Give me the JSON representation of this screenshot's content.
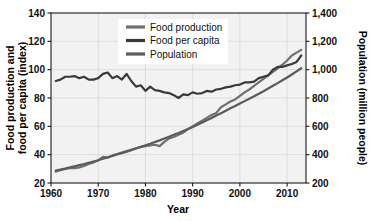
{
  "chart_data": {
    "type": "line",
    "title": "",
    "subtitle": "",
    "xlabel": "Year",
    "ylabel": "Food production and food per capita (index)",
    "ylabel_line1": "Food production and",
    "ylabel_line2": "food per capita (index)",
    "y2label": "Population (million people)",
    "xlim": [
      1960,
      2014
    ],
    "ylim": [
      20,
      140
    ],
    "y2lim": [
      200,
      1400
    ],
    "grid": true,
    "legend_position": "top-center",
    "xticks": [
      1960,
      1970,
      1980,
      1990,
      2000,
      2010
    ],
    "xticklabels": [
      "1960",
      "1970",
      "1980",
      "1990",
      "2000",
      "2010"
    ],
    "yticks": [
      20,
      40,
      60,
      80,
      100,
      120,
      140
    ],
    "yticklabels": [
      "20",
      "40",
      "60",
      "80",
      "100",
      "120",
      "140"
    ],
    "y2ticks": [
      200,
      400,
      600,
      800,
      1000,
      1200,
      1400
    ],
    "y2ticklabels": [
      "200",
      "400",
      "600",
      "800",
      "1,000",
      "1,200",
      "1,400"
    ],
    "x": [
      1961,
      1962,
      1963,
      1964,
      1965,
      1966,
      1967,
      1968,
      1969,
      1970,
      1971,
      1972,
      1973,
      1974,
      1975,
      1976,
      1977,
      1978,
      1979,
      1980,
      1981,
      1982,
      1983,
      1984,
      1985,
      1986,
      1987,
      1988,
      1989,
      1990,
      1991,
      1992,
      1993,
      1994,
      1995,
      1996,
      1997,
      1998,
      1999,
      2000,
      2001,
      2002,
      2003,
      2004,
      2005,
      2006,
      2007,
      2008,
      2009,
      2010,
      2011,
      2012,
      2013
    ],
    "series": [
      {
        "name": "Food production",
        "axis": "left",
        "color": "#6f6f6f",
        "units": "index",
        "values": [
          28,
          29,
          30,
          30.5,
          30.5,
          31,
          32,
          33.5,
          34.5,
          36,
          38.5,
          38,
          39.5,
          40.5,
          41.5,
          42.5,
          43.5,
          44.5,
          45.5,
          46,
          46.5,
          47,
          46,
          49,
          51.5,
          52.5,
          54,
          55.5,
          58,
          60,
          62,
          64,
          66,
          68,
          69.5,
          73.5,
          75.5,
          77.5,
          79,
          81.5,
          84,
          86,
          88.5,
          91,
          93.5,
          96,
          98.5,
          101,
          103.5,
          106.5,
          110,
          112,
          114
        ]
      },
      {
        "name": "Food per capita",
        "axis": "left",
        "color": "#3a3a3a",
        "units": "index",
        "values": [
          92,
          93,
          95,
          95,
          95.5,
          94,
          95,
          93,
          93,
          94,
          97,
          98,
          94,
          95.5,
          93,
          97,
          92,
          88,
          89,
          85,
          88,
          85.5,
          85,
          84,
          83.5,
          82,
          80,
          82.5,
          82,
          84,
          83,
          83.5,
          85,
          84.5,
          86,
          86.5,
          87.5,
          88,
          89,
          89.5,
          91,
          91,
          91.5,
          94,
          95,
          96,
          100,
          102,
          102,
          103,
          104,
          105.5,
          110
        ]
      },
      {
        "name": "Population",
        "axis": "right",
        "color": "#5a5a5a",
        "units": "million people",
        "values": [
          288,
          295,
          302,
          310,
          318,
          326,
          334,
          343,
          352,
          361,
          371,
          381,
          391,
          401,
          411,
          421,
          432,
          443,
          454,
          466,
          477,
          489,
          501,
          514,
          527,
          540,
          553,
          567,
          581,
          596,
          611,
          627,
          643,
          659,
          676,
          693,
          710,
          727,
          744,
          761,
          778,
          795,
          812,
          830,
          848,
          867,
          886,
          905,
          925,
          945,
          966,
          988,
          1010
        ]
      }
    ],
    "legend": [
      {
        "label": "Food production",
        "color": "#6f6f6f"
      },
      {
        "label": "Food per capita",
        "color": "#3a3a3a"
      },
      {
        "label": "Population",
        "color": "#5a5a5a"
      }
    ]
  },
  "colors": {
    "plot_background": "#f2f2f2",
    "page_background": "#ffffff",
    "gridline": "#d8d8d8",
    "axis": "#1a1a1a",
    "text": "#111111"
  }
}
